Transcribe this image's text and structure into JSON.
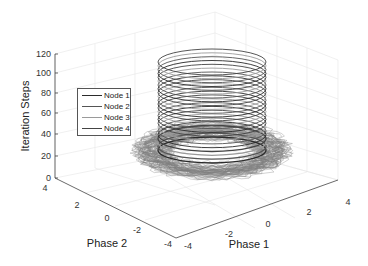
{
  "chart_data": {
    "type": "line",
    "subtype": "3d-line",
    "title": "",
    "xlabel": "Phase 1",
    "ylabel": "Phase 2",
    "zlabel": "Iteration Steps",
    "xlim": [
      -4,
      4
    ],
    "ylim": [
      -4,
      4
    ],
    "zlim": [
      0,
      120
    ],
    "x_ticks": [
      "-4",
      "-2",
      "0",
      "2",
      "4"
    ],
    "y_ticks": [
      "-4",
      "-2",
      "0",
      "2",
      "4"
    ],
    "z_ticks": [
      "0",
      "20",
      "40",
      "60",
      "80",
      "100",
      "120"
    ],
    "grid": true,
    "legend_position": "upper-left inside",
    "series": [
      {
        "name": "Node 1",
        "color": "#2b2b2b",
        "description": "noisy trajectory near z=0..10 converging to circular orbit radius ~2, then helix rising to z~120"
      },
      {
        "name": "Node 2",
        "color": "#555555",
        "description": "helix, radius ~2, z 0..120"
      },
      {
        "name": "Node 3",
        "color": "#9a9a9a",
        "description": "helix, radius ~2, z 0..120"
      },
      {
        "name": "Node 4",
        "color": "#444444",
        "description": "helix, radius ~2, z 0..120"
      }
    ],
    "helix": {
      "center": [
        0,
        0
      ],
      "radius": 2,
      "turns_visible": 24,
      "z_range": [
        0,
        120
      ]
    }
  },
  "legend": {
    "items": [
      {
        "label": "Node 1"
      },
      {
        "label": "Node 2"
      },
      {
        "label": "Node 3"
      },
      {
        "label": "Node 4"
      }
    ]
  },
  "axes": {
    "zlabel": "Iteration Steps",
    "xlabel": "Phase 1",
    "ylabel": "Phase 2",
    "z_ticks": [
      {
        "label": "120",
        "y": 54
      },
      {
        "label": "100",
        "y": 73
      },
      {
        "label": "80",
        "y": 93
      },
      {
        "label": "60",
        "y": 113
      },
      {
        "label": "40",
        "y": 134
      },
      {
        "label": "20",
        "y": 156
      },
      {
        "label": "0",
        "y": 178
      }
    ],
    "phase2_ticks": [
      {
        "label": "4",
        "x": 45,
        "y": 188
      },
      {
        "label": "2",
        "x": 77,
        "y": 205
      },
      {
        "label": "0",
        "x": 107,
        "y": 218
      },
      {
        "label": "-2",
        "x": 137,
        "y": 230
      },
      {
        "label": "-4",
        "x": 168,
        "y": 244
      }
    ],
    "phase1_ticks": [
      {
        "label": "-4",
        "x": 188,
        "y": 246
      },
      {
        "label": "-2",
        "x": 229,
        "y": 234
      },
      {
        "label": "0",
        "x": 268,
        "y": 224
      },
      {
        "label": "2",
        "x": 309,
        "y": 212
      },
      {
        "label": "4",
        "x": 347,
        "y": 202
      }
    ]
  }
}
